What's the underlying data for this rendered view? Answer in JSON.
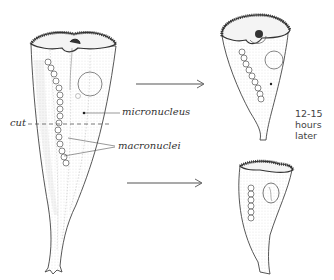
{
  "diagram": {
    "labels": {
      "cut": "cut",
      "micronucleus": "micronucleus",
      "macronuclei": "macronuclei"
    },
    "time_note": {
      "line1": "12-15",
      "line2": "hours",
      "line3": "later"
    },
    "figures": [
      {
        "id": "original",
        "description": "Whole Stentor with cut line across body"
      },
      {
        "id": "anterior-regenerated",
        "description": "Anterior fragment regenerated into complete organism"
      },
      {
        "id": "posterior-regenerated",
        "description": "Posterior fragment regenerated into complete organism"
      }
    ],
    "arrows": [
      {
        "from": "original",
        "to": "anterior-regenerated"
      },
      {
        "from": "original",
        "to": "posterior-regenerated"
      }
    ],
    "colors": {
      "ink": "#333333",
      "shading": "#8a8a8a",
      "background": "#ffffff"
    }
  }
}
